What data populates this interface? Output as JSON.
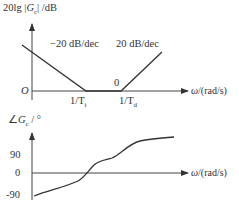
{
  "magnitude_plot": {
    "ylabel": "20lg |G_c| /dB",
    "ylabel_prefix": "20lg",
    "ylabel_var": "G",
    "ylabel_sub": "c",
    "ylabel_unit": "/dB",
    "origin": "O",
    "xlabel": "ω /(rad/s)",
    "xlabel_var": "ω",
    "xlabel_unit": "/(rad/s)",
    "slope_left": "−20 dB/dec",
    "slope_right": "20 dB/dec",
    "flat_label": "0",
    "break_1": "1/T",
    "break_1_sub": "i",
    "break_2": "1/T",
    "break_2_sub": "d"
  },
  "phase_plot": {
    "ylabel_prefix": "∠",
    "ylabel_var": "G",
    "ylabel_sub": "c",
    "ylabel_unit": "/ °",
    "ticks": [
      "90",
      "0",
      "-90"
    ],
    "xlabel_var": "ω",
    "xlabel_unit": "/(rad/s)"
  },
  "colors": {
    "line": "#333333",
    "axis": "#444444"
  }
}
